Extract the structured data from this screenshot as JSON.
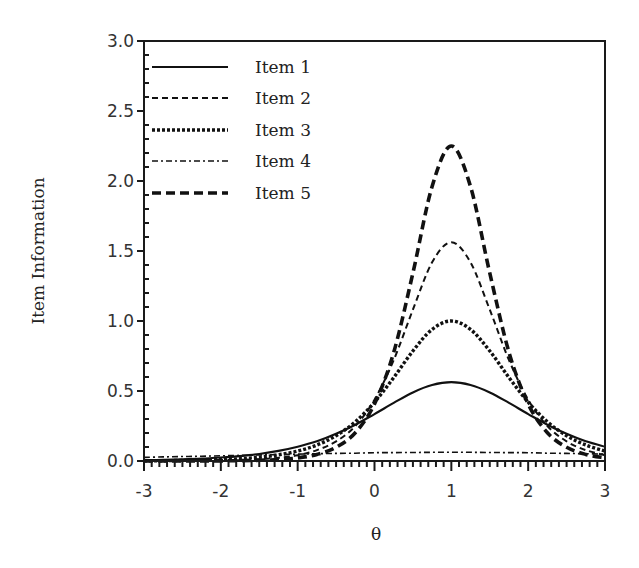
{
  "chart_data": {
    "type": "line",
    "title": "",
    "xlabel": "θ",
    "ylabel": "Item Information",
    "xlim": [
      -3,
      3
    ],
    "ylim": [
      0,
      3.0
    ],
    "x_ticks": [
      "-3",
      "-2",
      "-1",
      "0",
      "1",
      "2",
      "3"
    ],
    "y_ticks": [
      "0.0",
      "0.5",
      "1.0",
      "1.5",
      "2.0",
      "2.5",
      "3.0"
    ],
    "grid": false,
    "legend_position": "upper-left",
    "x": [
      -3,
      -2.75,
      -2.5,
      -2.25,
      -2,
      -1.75,
      -1.5,
      -1.25,
      -1,
      -0.75,
      -0.5,
      -0.25,
      0,
      0.25,
      0.5,
      0.75,
      1,
      1.25,
      1.5,
      1.75,
      2,
      2.25,
      2.5,
      2.75,
      3
    ],
    "series": [
      {
        "name": "Item 1",
        "style": "solid",
        "values": [
          0.006,
          0.008,
          0.012,
          0.017,
          0.025,
          0.035,
          0.05,
          0.072,
          0.102,
          0.141,
          0.194,
          0.259,
          0.335,
          0.415,
          0.49,
          0.543,
          0.563,
          0.543,
          0.49,
          0.415,
          0.335,
          0.259,
          0.194,
          0.141,
          0.102
        ]
      },
      {
        "name": "Item 2",
        "style": "dashed",
        "values": [
          0.0,
          0.001,
          0.001,
          0.002,
          0.003,
          0.006,
          0.012,
          0.023,
          0.041,
          0.078,
          0.14,
          0.25,
          0.438,
          0.721,
          1.081,
          1.419,
          1.563,
          1.419,
          1.081,
          0.721,
          0.438,
          0.25,
          0.14,
          0.078,
          0.041
        ]
      },
      {
        "name": "Item 3",
        "style": "dotted",
        "values": [
          0.001,
          0.002,
          0.004,
          0.006,
          0.01,
          0.016,
          0.027,
          0.044,
          0.071,
          0.114,
          0.181,
          0.28,
          0.42,
          0.596,
          0.786,
          0.94,
          1.0,
          0.94,
          0.786,
          0.596,
          0.42,
          0.28,
          0.181,
          0.114,
          0.071
        ]
      },
      {
        "name": "Item 4",
        "style": "dash-dot",
        "values": [
          0.026,
          0.029,
          0.032,
          0.034,
          0.037,
          0.04,
          0.043,
          0.046,
          0.049,
          0.052,
          0.054,
          0.056,
          0.059,
          0.06,
          0.061,
          0.062,
          0.063,
          0.062,
          0.061,
          0.06,
          0.059,
          0.056,
          0.054,
          0.052,
          0.049
        ]
      },
      {
        "name": "Item 5",
        "style": "thick-dashed",
        "values": [
          0.0,
          0.0,
          0.0,
          0.001,
          0.001,
          0.002,
          0.005,
          0.011,
          0.022,
          0.047,
          0.098,
          0.202,
          0.407,
          0.776,
          1.342,
          1.961,
          2.25,
          1.961,
          1.342,
          0.776,
          0.407,
          0.202,
          0.098,
          0.047,
          0.022
        ]
      }
    ]
  }
}
